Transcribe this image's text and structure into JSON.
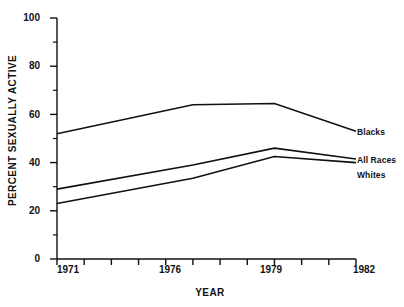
{
  "chart_data": {
    "type": "line",
    "title": "",
    "xlabel": "YEAR",
    "ylabel": "PERCENT SEXUALLY ACTIVE",
    "xlim": [
      1971,
      1982
    ],
    "ylim": [
      0,
      100
    ],
    "grid": false,
    "legend_position": "right-end-of-line",
    "x": [
      1971,
      1976,
      1979,
      1982
    ],
    "x_tick_labels": [
      "1971",
      "1976",
      "1979",
      "1982"
    ],
    "x_minor_ticks": [
      1972,
      1973,
      1974,
      1975,
      1977,
      1978,
      1980,
      1981
    ],
    "y_tick_labels": [
      "0",
      "20",
      "40",
      "60",
      "80",
      "100"
    ],
    "y_ticks": [
      0,
      20,
      40,
      60,
      80,
      100
    ],
    "y_minor_ticks": [
      10,
      30,
      50,
      70,
      90
    ],
    "series": [
      {
        "name": "Blacks",
        "values": [
          52,
          64,
          64.5,
          53
        ]
      },
      {
        "name": "All Races",
        "values": [
          29,
          39,
          46,
          41.5
        ]
      },
      {
        "name": "Whites",
        "values": [
          23,
          33.5,
          42.5,
          40
        ]
      }
    ]
  },
  "style": {
    "line_color": "#111111",
    "axis_color": "#111111",
    "background": "#ffffff"
  }
}
